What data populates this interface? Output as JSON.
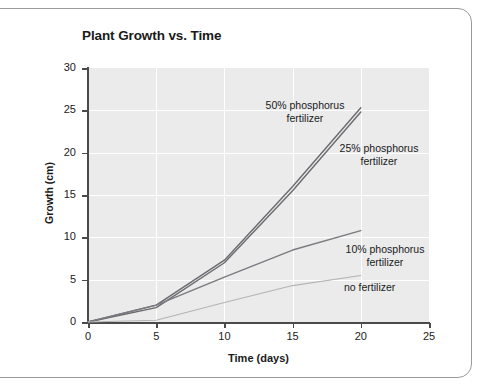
{
  "figure": {
    "title": "Plant Growth vs. Time"
  },
  "chart_data": {
    "type": "line",
    "title": "Plant Growth vs. Time",
    "xlabel": "Time (days)",
    "ylabel": "Growth (cm)",
    "xlim": [
      0,
      25
    ],
    "ylim": [
      0,
      30
    ],
    "xticks": [
      0,
      5,
      10,
      15,
      20,
      25
    ],
    "yticks": [
      0,
      5,
      10,
      15,
      20,
      25,
      30
    ],
    "xtick_labels": [
      "0",
      "5",
      "10",
      "15",
      "20",
      "25"
    ],
    "ytick_labels": [
      "0",
      "5",
      "10",
      "15",
      "20",
      "25",
      "30"
    ],
    "grid": true,
    "grid_color": "#ffffff",
    "plot_background": "#ebebeb",
    "legend": "annotations",
    "x": [
      0,
      5,
      10,
      15,
      20
    ],
    "series": [
      {
        "name": "50% phosphorus fertilizer",
        "label": "50% phosphorus\nfertilizer",
        "color": "#6a6a70",
        "values": [
          0,
          2.0,
          7.3,
          16.0,
          25.3
        ]
      },
      {
        "name": "25% phosphorus fertilizer",
        "label": "25% phosphorus\nfertilizer",
        "color": "#6a6a70",
        "values": [
          0,
          1.7,
          7.0,
          15.5,
          24.8
        ]
      },
      {
        "name": "10% phosphorus fertilizer",
        "label": "10% phosphorus\nfertilizer",
        "color": "#7a7a80",
        "values": [
          0,
          2.0,
          5.3,
          8.5,
          10.8
        ]
      },
      {
        "name": "no fertilizer",
        "label": "no fertilizer",
        "color": "#b4b4b8",
        "values": [
          0,
          0.2,
          2.3,
          4.3,
          5.5
        ]
      }
    ]
  }
}
